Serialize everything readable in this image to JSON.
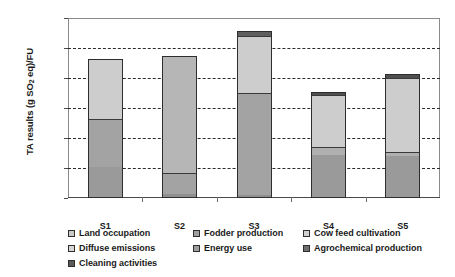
{
  "chart_data": {
    "type": "bar",
    "subtype": "stacked-bar",
    "title": "",
    "xlabel": "",
    "ylabel": "TA results (g SO2 eq)/FU",
    "ylabel_parts": {
      "pre": "TA results (g SO",
      "sub": "2",
      "post": " eq)/FU"
    },
    "categories": [
      "S1",
      "S2",
      "S3",
      "S4",
      "S5"
    ],
    "ylim": [
      0,
      120
    ],
    "yticks": [
      0,
      20,
      40,
      60,
      80,
      100,
      120
    ],
    "ytick_labels": [
      "0.0",
      "20.0",
      "40.0",
      "60.0",
      "80.0",
      "100.0",
      "120.0"
    ],
    "grid": true,
    "grid_style": "dashed-horizontal",
    "legend_position": "bottom",
    "series": [
      {
        "name": "Land occupation",
        "color": "#9a9a9a",
        "values": [
          21.0,
          3.0,
          2.0,
          29.0,
          28.0
        ]
      },
      {
        "name": "Fodder production",
        "color": "#9a9a9a",
        "values": [
          0.0,
          0.0,
          0.0,
          0.0,
          0.0
        ]
      },
      {
        "name": "Cow feed cultivation",
        "color": "#9a9a9a",
        "values": [
          0.0,
          0.0,
          0.0,
          0.0,
          0.0
        ]
      },
      {
        "name": "Diffuse emissions",
        "color": "#a0a0a0",
        "values": [
          32.0,
          14.0,
          68.0,
          5.0,
          3.0
        ]
      },
      {
        "name": "Energy use",
        "color": "#cfcfcf",
        "values": [
          40.0,
          78.0,
          38.0,
          35.0,
          49.0
        ]
      },
      {
        "name": "Agrochemical production",
        "color": "#5e5e5e",
        "values": [
          0.0,
          0.0,
          3.5,
          2.0,
          3.0
        ]
      }
    ],
    "totals": [
      93.0,
      95.0,
      111.5,
      71.0,
      83.0
    ],
    "bars": [
      {
        "category": "S1",
        "total": 93.0,
        "segments": [
          {
            "label": "Land occupation",
            "value": 21.0,
            "color": "#9a9a9a"
          },
          {
            "label": "Diffuse emissions",
            "value": 32.0,
            "color": "#a3a3a3"
          },
          {
            "label": "Energy use",
            "value": 40.0,
            "color": "#cdcdcd"
          }
        ]
      },
      {
        "category": "S2",
        "total": 95.0,
        "segments": [
          {
            "label": "Land occupation",
            "value": 3.0,
            "color": "#8f8f8f"
          },
          {
            "label": "Diffuse emissions",
            "value": 14.0,
            "color": "#a3a3a3"
          },
          {
            "label": "Energy use",
            "value": 78.0,
            "color": "#b6b6b6"
          }
        ]
      },
      {
        "category": "S3",
        "total": 111.5,
        "segments": [
          {
            "label": "Land occupation",
            "value": 2.0,
            "color": "#8f8f8f"
          },
          {
            "label": "Diffuse emissions",
            "value": 68.0,
            "color": "#a3a3a3"
          },
          {
            "label": "Energy use",
            "value": 38.0,
            "color": "#cdcdcd"
          },
          {
            "label": "Agrochemical production",
            "value": 3.5,
            "color": "#5e5e5e"
          }
        ]
      },
      {
        "category": "S4",
        "total": 71.0,
        "segments": [
          {
            "label": "Land occupation",
            "value": 29.0,
            "color": "#9a9a9a"
          },
          {
            "label": "Diffuse emissions",
            "value": 5.0,
            "color": "#b0b0b0"
          },
          {
            "label": "Energy use",
            "value": 35.0,
            "color": "#cdcdcd"
          },
          {
            "label": "Agrochemical production",
            "value": 2.0,
            "color": "#4f4f4f"
          }
        ]
      },
      {
        "category": "S5",
        "total": 83.0,
        "segments": [
          {
            "label": "Land occupation",
            "value": 28.0,
            "color": "#9a9a9a"
          },
          {
            "label": "Diffuse emissions",
            "value": 3.0,
            "color": "#b0b0b0"
          },
          {
            "label": "Energy use",
            "value": 49.0,
            "color": "#cdcdcd"
          },
          {
            "label": "Agrochemical production",
            "value": 3.0,
            "color": "#4f4f4f"
          }
        ]
      }
    ],
    "legend": [
      {
        "label": "Land occupation",
        "color": "#c9c9c9",
        "col": 0,
        "row": 0
      },
      {
        "label": "Fodder production",
        "color": "#9e9e9e",
        "col": 1,
        "row": 0
      },
      {
        "label": "Cow feed cultivation",
        "color": "#cfcfcf",
        "col": 2,
        "row": 0
      },
      {
        "label": "Diffuse emissions",
        "color": "#d6d6d6",
        "col": 0,
        "row": 1
      },
      {
        "label": "Energy use",
        "color": "#9e9e9e",
        "col": 1,
        "row": 1
      },
      {
        "label": "Agrochemical production",
        "color": "#6e6e6e",
        "col": 2,
        "row": 1
      },
      {
        "label": "Cleaning activities",
        "color": "#5a5a5a",
        "col": 0,
        "row": 2
      }
    ]
  }
}
